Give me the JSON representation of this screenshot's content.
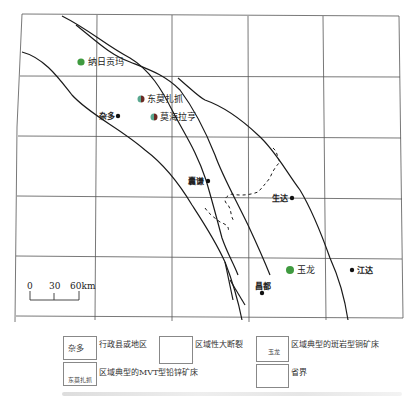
{
  "map": {
    "places": [
      {
        "name": "纳日贡玛",
        "type": "porphyry-copper-deposit",
        "x": 81,
        "y": 62
      },
      {
        "name": "东莫扎抓",
        "type": "mvt-lead-zinc-deposit",
        "x": 141,
        "y": 99
      },
      {
        "name": "莫海拉亨",
        "type": "mvt-lead-zinc-deposit",
        "x": 154,
        "y": 117
      },
      {
        "name": "杂多",
        "type": "county",
        "x": 118,
        "y": 116
      },
      {
        "name": "囊谦",
        "type": "county",
        "x": 208,
        "y": 181
      },
      {
        "name": "生达",
        "type": "county",
        "x": 292,
        "y": 198
      },
      {
        "name": "玉龙",
        "type": "porphyry-copper-deposit",
        "x": 290,
        "y": 270
      },
      {
        "name": "江达",
        "type": "county",
        "x": 352,
        "y": 270
      },
      {
        "name": "昌都",
        "type": "county",
        "x": 262,
        "y": 293
      }
    ],
    "scale_bar": {
      "labels": [
        "0",
        "30",
        "60km"
      ]
    }
  },
  "legend": {
    "items": [
      {
        "symbol_label": "杂多",
        "text": "行政县或地区"
      },
      {
        "text": "区域性大断裂"
      },
      {
        "symbol_label": "玉龙",
        "text": "区域典型的斑岩型铜矿床"
      },
      {
        "symbol_label": "东莫扎抓",
        "text": "区域典型的MVT型铅锌矿床"
      },
      {
        "text": "省界"
      }
    ]
  },
  "colors": {
    "porphyry": "#3f9a3f",
    "mvt_left": "#5aa890",
    "mvt_right": "#6b2a24",
    "line": "#1a1a1a",
    "grid": "#555555"
  }
}
